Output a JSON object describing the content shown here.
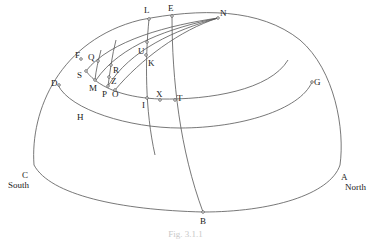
{
  "figure": {
    "caption": "Fig. 3.1.1",
    "labels": {
      "L": "L",
      "E": "E",
      "N": "N",
      "F": "F",
      "Q": "Q",
      "U": "U",
      "K": "K",
      "R": "R",
      "S": "S",
      "Z": "Z",
      "D": "D",
      "M": "M",
      "P": "P",
      "O": "O",
      "G": "G",
      "I": "I",
      "X": "X",
      "T": "T",
      "H": "H",
      "C": "C",
      "A": "A",
      "B": "B"
    },
    "directions": {
      "south": "South",
      "north": "North"
    },
    "colors": {
      "line": "#555555",
      "text": "#222222"
    }
  }
}
